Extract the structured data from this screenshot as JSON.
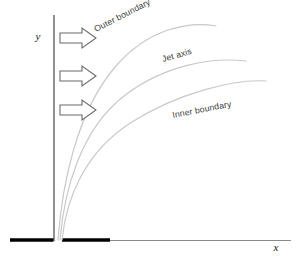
{
  "figure": {
    "background_color": "#ffffff"
  },
  "axes": {
    "y_label": "y",
    "x_label": "x",
    "axis_color": "#555555",
    "y_axis": {
      "x": 54,
      "y_top": 15,
      "y_bottom": 241
    },
    "x_axis": {
      "y": 241,
      "x_left": 110,
      "x_right": 291
    }
  },
  "walls": {
    "color": "#000000",
    "left_wall": {
      "x1": 10,
      "x2": 54,
      "y": 240
    },
    "right_wall": {
      "x1": 62,
      "x2": 110,
      "y": 240
    },
    "gap": {
      "x1": 54,
      "x2": 62
    }
  },
  "arrows": {
    "count": 3,
    "label": "inflow-arrow",
    "stroke_color": "#6b6b6b",
    "fill_color": "#ffffff",
    "positions": [
      {
        "x": 60,
        "y": 28,
        "width": 36,
        "height": 20
      },
      {
        "x": 60,
        "y": 66,
        "width": 36,
        "height": 20
      },
      {
        "x": 60,
        "y": 100,
        "width": 36,
        "height": 20
      }
    ]
  },
  "curves": {
    "color": "#c8c8c8",
    "items": [
      {
        "name": "outer-boundary",
        "label": "Outer boundary",
        "label_x": 96,
        "label_y": 32,
        "label_rotation": -27,
        "start": {
          "x": 58,
          "y": 240
        },
        "end": {
          "x": 216,
          "y": 26
        }
      },
      {
        "name": "jet-axis",
        "label": "Jet axis",
        "label_x": 163,
        "label_y": 62,
        "label_rotation": -16,
        "start": {
          "x": 60,
          "y": 240
        },
        "end": {
          "x": 246,
          "y": 61
        }
      },
      {
        "name": "inner-boundary",
        "label": "Inner boundary",
        "label_x": 173,
        "label_y": 118,
        "label_rotation": -11,
        "start": {
          "x": 62,
          "y": 240
        },
        "end": {
          "x": 266,
          "y": 81
        }
      }
    ]
  }
}
